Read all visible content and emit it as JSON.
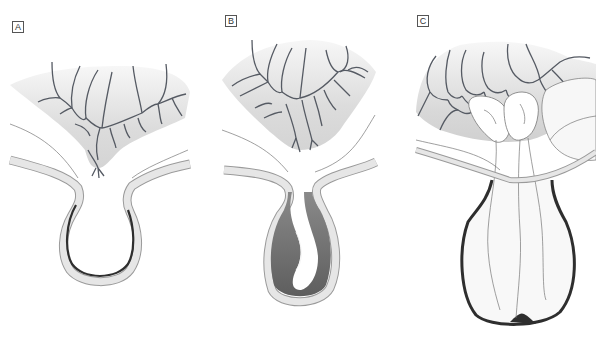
{
  "figure": {
    "panels": [
      {
        "id": "A",
        "label": "A"
      },
      {
        "id": "B",
        "label": "B"
      },
      {
        "id": "C",
        "label": "C"
      }
    ]
  },
  "colors": {
    "background": "#ffffff",
    "vessel_stroke": "#555a63",
    "mesentery_fill": "#dcdcdc",
    "mesentery_fade": "#f7f7f7",
    "wall_fill": "#e6e6e6",
    "wall_outline": "#9a9a9a",
    "dark_lining": "#2e2e2e",
    "fluid_fill": "#6e6e6e",
    "label_border": "#555555"
  }
}
